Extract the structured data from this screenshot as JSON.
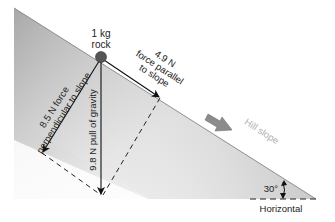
{
  "diagram": {
    "object_label_line1": "1 kg",
    "object_label_line2": "rock",
    "perpendicular_label_line1": "8.5 N force",
    "perpendicular_label_line2": "perpendicular to slope",
    "gravity_label": "9.8 N pull of gravity",
    "parallel_label_line1": "4.9 N",
    "parallel_label_line2": "force parallel",
    "parallel_label_line3": "to slope",
    "slope_label": "Hill slope",
    "angle_label": "30°",
    "horizontal_label": "Horizontal"
  },
  "forces": [
    {
      "name": "gravity",
      "magnitude_N": 9.8,
      "direction": "vertical down"
    },
    {
      "name": "perpendicular",
      "magnitude_N": 8.5,
      "direction": "perpendicular to slope"
    },
    {
      "name": "parallel",
      "magnitude_N": 4.9,
      "direction": "parallel to slope"
    }
  ],
  "slope_angle_deg": 30,
  "mass_kg": 1,
  "colors": {
    "slope_dark": "#9a9a9a",
    "slope_light": "#ffffff",
    "arrow": "#111111",
    "hill_arrow": "#8c8c8c",
    "hill_label": "#b0b0b0",
    "rock": "#555555"
  }
}
